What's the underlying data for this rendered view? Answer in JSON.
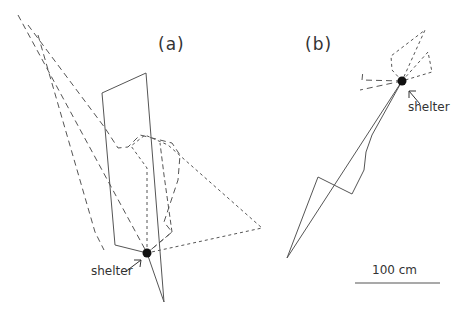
{
  "figure": {
    "panel_a": {
      "label": "(a)",
      "shelter_label": "shelter"
    },
    "panel_b": {
      "label": "(b)",
      "shelter_label": "shelter"
    },
    "scale_bar": {
      "label": "100 cm"
    }
  },
  "colors": {
    "line": "#555555",
    "marker": "#111111",
    "text": "#333333"
  }
}
